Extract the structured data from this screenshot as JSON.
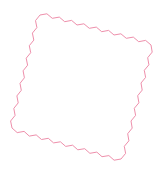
{
  "shape": {
    "type": "zigzag-quadrilateral",
    "stroke_color": "#ee8fab",
    "fill_color": "#ffffff",
    "stroke_width": 1,
    "corners": [
      [
        40,
        15
      ],
      [
        151,
        45
      ],
      [
        121,
        159
      ],
      [
        12,
        128
      ]
    ],
    "teeth_per_edge": [
      9,
      9,
      9,
      9
    ],
    "tooth_amplitude": 3
  }
}
